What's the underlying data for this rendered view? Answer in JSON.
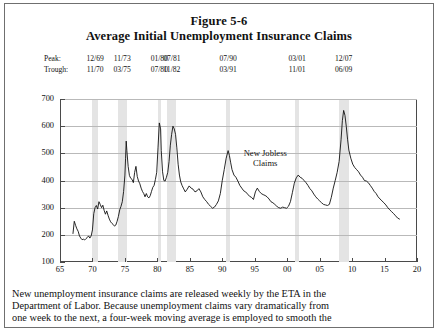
{
  "figure": {
    "title": "Figure 5-6",
    "subtitle": "Average Initial Unemployment Insurance Claims"
  },
  "recession_table": {
    "peak_label": "Peak:",
    "trough_label": "Trough:",
    "peaks": [
      "12/69",
      "11/73",
      "01/80",
      "07/81",
      "07/90",
      "03/01",
      "12/07"
    ],
    "troughs": [
      "11/70",
      "03/75",
      "07/80",
      "11/82",
      "03/91",
      "11/01",
      "06/09"
    ]
  },
  "caption": {
    "line1": "New unemployment insurance claims are released weekly by the ETA in the",
    "line2": "Department of Labor.  Because unemployment claims vary dramatically from",
    "line3": "one week to the next, a four-week moving average is employed to smooth the"
  },
  "chart_data": {
    "type": "line",
    "title": "Average Initial Unemployment Insurance Claims",
    "xlabel": "",
    "ylabel": "Thousands of Claims",
    "xlim": [
      65,
      20
    ],
    "ylim": [
      100,
      700
    ],
    "xticks": [
      "65",
      "70",
      "75",
      "80",
      "85",
      "90",
      "95",
      "00",
      "05",
      "10",
      "15",
      "20"
    ],
    "xtick_values": [
      65,
      70,
      75,
      80,
      85,
      90,
      95,
      100,
      105,
      110,
      115,
      120
    ],
    "yticks": [
      100,
      200,
      300,
      400,
      500,
      600,
      700
    ],
    "grid": true,
    "legend": "none",
    "series_name": "New Jobless Claims",
    "annotation": {
      "line1": "New Jobless",
      "line2": "Claims"
    },
    "line_color": "#111111",
    "band_color": "#e4e4e4",
    "recession_bands": [
      {
        "start": 69.92,
        "end": 70.92
      },
      {
        "start": 73.92,
        "end": 75.25
      },
      {
        "start": 80.05,
        "end": 80.55
      },
      {
        "start": 81.55,
        "end": 82.92
      },
      {
        "start": 90.55,
        "end": 91.25
      },
      {
        "start": 101.2,
        "end": 101.88
      },
      {
        "start": 107.95,
        "end": 109.45
      }
    ],
    "x": [
      67.0,
      67.2,
      67.4,
      67.6,
      67.8,
      68.0,
      68.2,
      68.4,
      68.6,
      68.8,
      69.0,
      69.2,
      69.4,
      69.6,
      69.8,
      70.0,
      70.2,
      70.4,
      70.6,
      70.8,
      71.0,
      71.2,
      71.4,
      71.6,
      71.8,
      72.0,
      72.2,
      72.4,
      72.6,
      72.8,
      73.0,
      73.2,
      73.4,
      73.6,
      73.8,
      74.0,
      74.2,
      74.4,
      74.6,
      74.8,
      75.0,
      75.1,
      75.2,
      75.3,
      75.5,
      75.7,
      75.9,
      76.1,
      76.3,
      76.5,
      76.7,
      76.9,
      77.1,
      77.3,
      77.5,
      77.7,
      77.9,
      78.1,
      78.3,
      78.5,
      78.7,
      78.9,
      79.1,
      79.3,
      79.5,
      79.7,
      79.9,
      80.1,
      80.3,
      80.5,
      80.6,
      80.8,
      81.0,
      81.2,
      81.4,
      81.6,
      81.8,
      82.0,
      82.2,
      82.4,
      82.6,
      82.8,
      83.0,
      83.2,
      83.4,
      83.6,
      83.8,
      84.0,
      84.3,
      84.6,
      84.9,
      85.2,
      85.5,
      85.8,
      86.1,
      86.4,
      86.7,
      87.0,
      87.3,
      87.6,
      87.9,
      88.2,
      88.5,
      88.8,
      89.1,
      89.4,
      89.7,
      90.0,
      90.3,
      90.6,
      90.9,
      91.1,
      91.3,
      91.5,
      91.8,
      92.1,
      92.4,
      92.7,
      93.0,
      93.3,
      93.6,
      93.9,
      94.2,
      94.5,
      94.8,
      95.1,
      95.4,
      95.7,
      96.0,
      96.3,
      96.6,
      96.9,
      97.2,
      97.5,
      97.8,
      98.1,
      98.4,
      98.7,
      99.0,
      99.3,
      99.6,
      99.9,
      100.2,
      100.5,
      100.8,
      101.1,
      101.4,
      101.7,
      102.0,
      102.3,
      102.6,
      102.9,
      103.2,
      103.5,
      103.8,
      104.1,
      104.4,
      104.7,
      105.0,
      105.3,
      105.6,
      105.9,
      106.2,
      106.5,
      106.8,
      107.1,
      107.4,
      107.7,
      108.0,
      108.3,
      108.5,
      108.7,
      108.9,
      109.1,
      109.3,
      109.5,
      109.8,
      110.1,
      110.4,
      110.7,
      111.0,
      111.3,
      111.6,
      111.9,
      112.2,
      112.5,
      112.8,
      113.1,
      113.4,
      113.7,
      114.0,
      114.3,
      114.6,
      114.9,
      115.2,
      115.5,
      115.8,
      116.1,
      116.4,
      116.7,
      117.0,
      117.3
    ],
    "y": [
      205,
      250,
      235,
      222,
      213,
      196,
      188,
      182,
      184,
      181,
      186,
      190,
      196,
      188,
      196,
      218,
      278,
      300,
      308,
      295,
      322,
      312,
      300,
      309,
      290,
      276,
      288,
      272,
      258,
      248,
      242,
      238,
      232,
      236,
      250,
      268,
      292,
      305,
      322,
      360,
      420,
      480,
      545,
      510,
      452,
      418,
      408,
      404,
      392,
      430,
      452,
      415,
      398,
      388,
      372,
      360,
      352,
      340,
      352,
      340,
      336,
      344,
      360,
      375,
      382,
      404,
      430,
      520,
      612,
      590,
      510,
      432,
      400,
      398,
      412,
      430,
      470,
      530,
      570,
      600,
      590,
      570,
      520,
      460,
      420,
      395,
      382,
      372,
      358,
      368,
      380,
      372,
      368,
      358,
      362,
      370,
      358,
      340,
      330,
      322,
      312,
      305,
      298,
      302,
      312,
      325,
      352,
      400,
      440,
      482,
      510,
      492,
      465,
      440,
      420,
      412,
      398,
      382,
      372,
      362,
      358,
      350,
      342,
      338,
      330,
      358,
      372,
      360,
      352,
      348,
      345,
      340,
      332,
      322,
      318,
      312,
      305,
      300,
      298,
      302,
      300,
      298,
      305,
      322,
      355,
      390,
      410,
      420,
      412,
      408,
      400,
      392,
      382,
      370,
      362,
      350,
      340,
      332,
      325,
      318,
      312,
      310,
      308,
      312,
      338,
      372,
      400,
      430,
      470,
      550,
      620,
      658,
      640,
      600,
      552,
      512,
      482,
      460,
      448,
      440,
      432,
      420,
      412,
      400,
      398,
      392,
      382,
      372,
      360,
      352,
      340,
      332,
      325,
      318,
      310,
      300,
      292,
      285,
      278,
      270,
      262,
      258
    ]
  }
}
